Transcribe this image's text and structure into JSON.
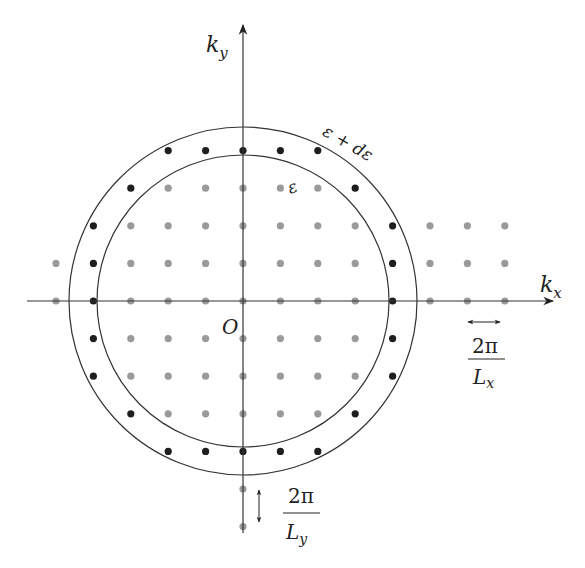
{
  "diagram": {
    "colors": {
      "background": "#ffffff",
      "axis": "#333333",
      "circle": "#333333",
      "dot_inner": "#9a9a9a",
      "dot_shell": "#1e1e1e"
    },
    "geometry": {
      "origin_px": [
        243,
        301
      ],
      "dx_px": 37.4,
      "dy_px": 37.6,
      "inner_radius_px": 146,
      "outer_radius_px": 174,
      "dot_radius_px": 3.6
    },
    "axes": {
      "x": {
        "label_main": "k",
        "label_sub": "x",
        "from_px": 27,
        "to_px": 553
      },
      "y": {
        "label_main": "k",
        "label_sub": "y",
        "from_px": 533,
        "to_px": 25
      },
      "origin_label": "O"
    },
    "circles": {
      "inner_label": "ε",
      "outer_label": "ε + dε"
    },
    "spacing_annotations": {
      "x": {
        "numerator": "2π",
        "denominator_main": "L",
        "denominator_sub": "x"
      },
      "y": {
        "numerator": "2π",
        "denominator_main": "L",
        "denominator_sub": "y"
      }
    },
    "dots": {
      "shell": [
        [
          -2,
          4
        ],
        [
          -1,
          4
        ],
        [
          0,
          4
        ],
        [
          1,
          4
        ],
        [
          2,
          4
        ],
        [
          -3,
          3
        ],
        [
          3,
          3
        ],
        [
          -4,
          2
        ],
        [
          4,
          2
        ],
        [
          -4,
          1
        ],
        [
          4,
          1
        ],
        [
          -4,
          0
        ],
        [
          4,
          0
        ],
        [
          -4,
          -1
        ],
        [
          4,
          -1
        ],
        [
          -4,
          -2
        ],
        [
          4,
          -2
        ],
        [
          -3,
          -3
        ],
        [
          3,
          -3
        ],
        [
          -2,
          -4
        ],
        [
          -1,
          -4
        ],
        [
          0,
          -4
        ],
        [
          1,
          -4
        ],
        [
          2,
          -4
        ]
      ],
      "inner": [
        [
          -2,
          3
        ],
        [
          -1,
          3
        ],
        [
          0,
          3
        ],
        [
          1,
          3
        ],
        [
          2,
          3
        ],
        [
          -3,
          2
        ],
        [
          -2,
          2
        ],
        [
          -1,
          2
        ],
        [
          0,
          2
        ],
        [
          1,
          2
        ],
        [
          2,
          2
        ],
        [
          3,
          2
        ],
        [
          5,
          2
        ],
        [
          6,
          2
        ],
        [
          7,
          2
        ],
        [
          -5,
          1
        ],
        [
          -3,
          1
        ],
        [
          -2,
          1
        ],
        [
          -1,
          1
        ],
        [
          0,
          1
        ],
        [
          1,
          1
        ],
        [
          2,
          1
        ],
        [
          3,
          1
        ],
        [
          5,
          1
        ],
        [
          6,
          1
        ],
        [
          7,
          1
        ],
        [
          -5,
          0
        ],
        [
          -3,
          0
        ],
        [
          -2,
          0
        ],
        [
          -1,
          0
        ],
        [
          0,
          0
        ],
        [
          1,
          0
        ],
        [
          2,
          0
        ],
        [
          3,
          0
        ],
        [
          5,
          0
        ],
        [
          6,
          0
        ],
        [
          7,
          0
        ],
        [
          -3,
          -1
        ],
        [
          -2,
          -1
        ],
        [
          -1,
          -1
        ],
        [
          0,
          -1
        ],
        [
          1,
          -1
        ],
        [
          2,
          -1
        ],
        [
          3,
          -1
        ],
        [
          -3,
          -2
        ],
        [
          -2,
          -2
        ],
        [
          -1,
          -2
        ],
        [
          0,
          -2
        ],
        [
          1,
          -2
        ],
        [
          2,
          -2
        ],
        [
          3,
          -2
        ],
        [
          -2,
          -3
        ],
        [
          -1,
          -3
        ],
        [
          0,
          -3
        ],
        [
          1,
          -3
        ],
        [
          2,
          -3
        ],
        [
          0,
          -5
        ],
        [
          0,
          -6
        ]
      ]
    }
  }
}
